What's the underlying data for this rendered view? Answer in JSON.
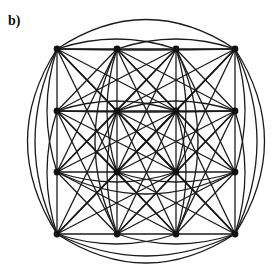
{
  "panel_label": "b)",
  "diagram": {
    "type": "graph",
    "node_color": "#111111",
    "edge_color": "#1a1a1a",
    "columns_x": [
      57,
      117,
      176,
      235
    ],
    "rows_y": [
      49,
      111,
      172,
      234
    ],
    "node_count": 16
  }
}
